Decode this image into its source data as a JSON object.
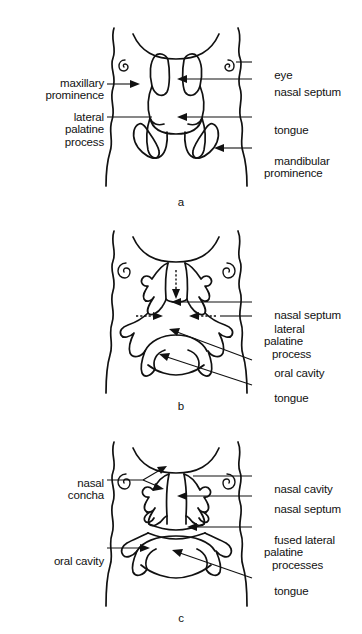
{
  "figure": {
    "type": "anatomical-diagram",
    "background_color": "#ffffff",
    "line_color": "#111111",
    "panel_count": 3
  },
  "panels": [
    {
      "id": "a",
      "letter": "a",
      "caption": "a",
      "stage": "early: lateral palatine processes vertical beside tongue",
      "labels_left": [
        {
          "id": "maxillary-prominence",
          "line1": "maxillary",
          "line2": "prominence",
          "arrow": true
        },
        {
          "id": "lateral-palatine-process",
          "line1": "lateral",
          "line2": "palatine",
          "line3": "process",
          "arrow": false
        }
      ],
      "labels_right": [
        {
          "id": "eye",
          "line1": "eye",
          "arrow": false
        },
        {
          "id": "nasal-septum",
          "line1": "nasal septum",
          "arrow": true
        },
        {
          "id": "tongue",
          "line1": "tongue",
          "arrow": true
        },
        {
          "id": "mandibular-prominence",
          "line1": "mandibular",
          "line2": "prominence",
          "arrow": true
        }
      ]
    },
    {
      "id": "b",
      "letter": "b",
      "caption": "b",
      "stage": "middle: palatine shelves elevating, septum descending",
      "labels_left": [],
      "labels_right": [
        {
          "id": "nasal-septum",
          "line1": "nasal septum",
          "arrow": true
        },
        {
          "id": "lateral-palatine-process",
          "line1": "lateral",
          "line2": "palatine",
          "line3": "process",
          "arrow": true
        },
        {
          "id": "oral-cavity",
          "line1": "oral cavity",
          "arrow": true
        },
        {
          "id": "tongue",
          "line1": "tongue",
          "arrow": true
        }
      ],
      "motion_arrows": [
        {
          "id": "septum-descent",
          "style": "dotted",
          "direction": "down"
        },
        {
          "id": "left-shelf-elevation",
          "style": "dotted",
          "direction": "right"
        },
        {
          "id": "right-shelf-elevation",
          "style": "dotted",
          "direction": "left"
        }
      ]
    },
    {
      "id": "c",
      "letter": "c",
      "caption": "c",
      "stage": "late: palatine processes fused, nasal and oral cavities separated",
      "labels_left": [
        {
          "id": "nasal-concha",
          "line1": "nasal",
          "line2": "concha",
          "arrow": true
        },
        {
          "id": "oral-cavity",
          "line1": "oral cavity",
          "arrow": true
        }
      ],
      "labels_right": [
        {
          "id": "nasal-cavity",
          "line1": "nasal cavity",
          "arrow": false
        },
        {
          "id": "nasal-septum",
          "line1": "nasal septum",
          "arrow": true
        },
        {
          "id": "fused-lateral-palatine-processes",
          "line1": "fused lateral",
          "line2": "palatine",
          "line3": "processes",
          "arrow": true
        },
        {
          "id": "tongue",
          "line1": "tongue",
          "arrow": true
        }
      ]
    }
  ],
  "icons": {
    "eye_left": "spiral-eye-icon",
    "eye_right": "spiral-eye-icon"
  }
}
